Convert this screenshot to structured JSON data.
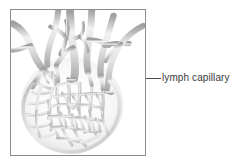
{
  "figure": {
    "frame": {
      "border_color": "#8d8d8d",
      "background": "#ffffff"
    },
    "illustration": {
      "name": "lymph-capillary-network",
      "description": "Grayscale anatomical drawing of a blind-ended lymphatic capillary network branching from collecting lymphatic vessels",
      "palette": {
        "vessel_outline": "#8a8a8a",
        "vessel_fill_light": "#f2f2f2",
        "vessel_fill_mid": "#cfcfcf",
        "vessel_shadow": "#9e9e9e",
        "background": "#ffffff"
      }
    }
  },
  "annotations": [
    {
      "id": "lymph-capillary",
      "label": "lymph capillary",
      "leader_line": {
        "color": "#4a4a4a",
        "orientation": "horizontal",
        "length_px": 15
      }
    }
  ]
}
